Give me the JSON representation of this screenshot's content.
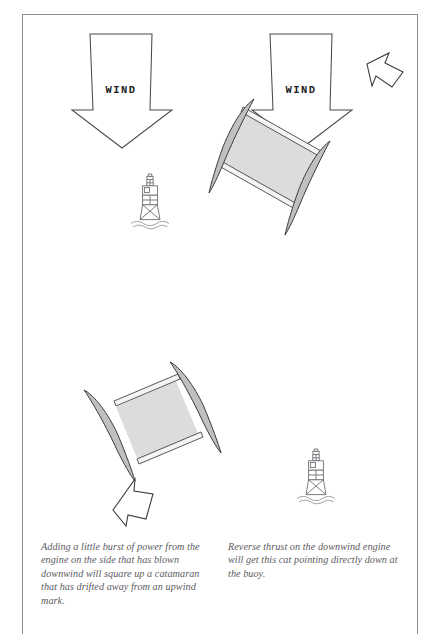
{
  "page": {
    "background_color": "#ffffff",
    "frame_color": "#8d8d93"
  },
  "figure": {
    "name": "catamaran-wind-diagram",
    "panels": [
      {
        "id": "left-panel",
        "wind_arrow_label": "WIND",
        "elements": [
          "wind-arrow",
          "buoy-mark",
          "catamaran",
          "thrust-arrow"
        ]
      },
      {
        "id": "right-panel",
        "wind_arrow_label": "WIND",
        "elements": [
          "wind-arrow",
          "catamaran",
          "thrust-arrow",
          "buoy-mark"
        ]
      }
    ],
    "colors": {
      "hull_fill": "#c8c8c8",
      "hull_stroke": "#3a3a3a",
      "deck_fill": "#dcdcdc",
      "outline": "#3b3b3b",
      "wind_arrow_stroke": "#4a4a4a",
      "buoy_stroke": "#6e6e74",
      "caption_text": "#5b5b63"
    }
  },
  "captions": {
    "left": "Adding a little burst of power from the engine on the side that has blown downwind will square up a catamaran that has drifted away from an upwind mark.",
    "right": "Reverse thrust on the downwind engine will get this cat pointing directly down at the buoy."
  },
  "labels": {
    "wind_left": "WIND",
    "wind_right": "WIND"
  }
}
